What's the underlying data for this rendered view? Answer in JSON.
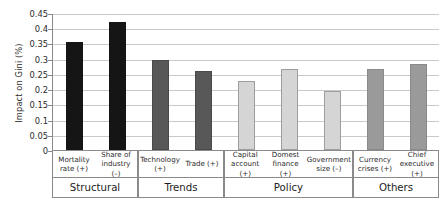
{
  "chart_data": {
    "type": "bar",
    "title": "",
    "xlabel": "",
    "ylabel": "Impact on Gini (%)",
    "ylim": [
      0,
      0.45
    ],
    "yticks": [
      "0",
      "0.05",
      "0.1",
      "0.15",
      "0.2",
      "0.25",
      "0.3",
      "0.35",
      "0.4",
      "0.45"
    ],
    "ytick_values": [
      0,
      0.05,
      0.1,
      0.15,
      0.2,
      0.25,
      0.3,
      0.35,
      0.4,
      0.45
    ],
    "grid": "horizontal",
    "legend": "none",
    "categories": [
      "Mortality rate (+)",
      "Share of industry (–)",
      "Technology (+)",
      "Trade (+)",
      "Capital account (+)",
      "Domest finance (+)",
      "Government size (–)",
      "Currency crises (+)",
      "Chief executive (+)"
    ],
    "values": [
      0.355,
      0.422,
      0.297,
      0.261,
      0.228,
      0.265,
      0.195,
      0.265,
      0.281
    ],
    "groups": [
      {
        "name": "Structural",
        "color": "#151515",
        "border": "#151515",
        "bars": [
          {
            "label": "Mortality rate (+)",
            "value": 0.355
          },
          {
            "label": "Share of industry (–)",
            "value": 0.422
          }
        ]
      },
      {
        "name": "Trends",
        "color": "#585858",
        "border": "#4a4a4a",
        "bars": [
          {
            "label": "Technology (+)",
            "value": 0.297
          },
          {
            "label": "Trade (+)",
            "value": 0.261
          }
        ]
      },
      {
        "name": "Policy",
        "color": "#d5d5d5",
        "border": "#9e9e9e",
        "bars": [
          {
            "label": "Capital account (+)",
            "value": 0.228
          },
          {
            "label": "Domest finance (+)",
            "value": 0.265
          },
          {
            "label": "Government size (–)",
            "value": 0.195
          }
        ]
      },
      {
        "name": "Others",
        "color": "#9a9a9a",
        "border": "#8a8a8a",
        "bars": [
          {
            "label": "Currency crises (+)",
            "value": 0.265
          },
          {
            "label": "Chief executive (+)",
            "value": 0.281
          }
        ]
      }
    ]
  }
}
